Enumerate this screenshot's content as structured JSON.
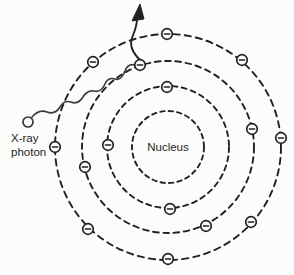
{
  "diagram": {
    "background_color": "#fcfcfa",
    "line_color": "#212121",
    "nucleus_label": "Nucleus",
    "photon_label": {
      "line1": "X-ray",
      "line2": "photon"
    },
    "center": {
      "x": 168,
      "y": 147
    },
    "shells": [
      {
        "radius": 36
      },
      {
        "radius": 61
      },
      {
        "radius": 86
      },
      {
        "radius": 113
      }
    ],
    "electrons": [
      {
        "shell": 2,
        "x": 167,
        "y": 87
      },
      {
        "shell": 2,
        "x": 108,
        "y": 145
      },
      {
        "shell": 2,
        "x": 170,
        "y": 209
      },
      {
        "shell": 3,
        "x": 140,
        "y": 65
      },
      {
        "shell": 3,
        "x": 85,
        "y": 167
      },
      {
        "shell": 3,
        "x": 252,
        "y": 129
      },
      {
        "shell": 3,
        "x": 206,
        "y": 226
      },
      {
        "shell": 4,
        "x": 167,
        "y": 34
      },
      {
        "shell": 4,
        "x": 93,
        "y": 62
      },
      {
        "shell": 4,
        "x": 242,
        "y": 60
      },
      {
        "shell": 4,
        "x": 55,
        "y": 147
      },
      {
        "shell": 4,
        "x": 281,
        "y": 138
      },
      {
        "shell": 4,
        "x": 88,
        "y": 229
      },
      {
        "shell": 4,
        "x": 251,
        "y": 222
      },
      {
        "shell": 4,
        "x": 168,
        "y": 259
      }
    ],
    "photon": {
      "x": 28,
      "y": 122,
      "radius": 5
    }
  }
}
